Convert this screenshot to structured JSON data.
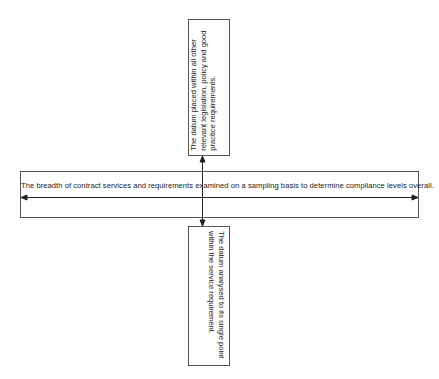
{
  "diagram": {
    "horizontal_box": {
      "text": "The breadth of contract services and requirements examined on a sampling basis to determine compliance levels overall."
    },
    "top_box": {
      "lines": [
        "The datum placed within all other",
        "relevant legislation, policy and good",
        "practice requirements."
      ]
    },
    "bottom_box": {
      "lines": [
        "The datum analysed to its single point",
        "within the service requirement."
      ]
    },
    "colors": {
      "border": "#555555",
      "line": "#222222",
      "text": "#222222"
    }
  }
}
